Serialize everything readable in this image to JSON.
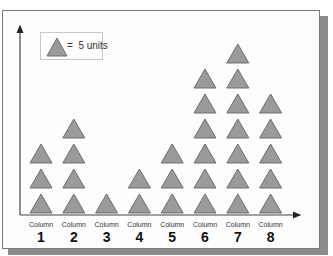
{
  "legend": {
    "icon": "triangle-icon",
    "equals": "=",
    "text": "5 units",
    "unit_value": 5
  },
  "colors": {
    "triangle_fill": "#9a9a9a",
    "triangle_stroke": "#6e6e6e",
    "axis": "#444444",
    "frame": "#7a7a7a",
    "shadow": "#8a8a8a"
  },
  "columns": [
    {
      "label": "Column",
      "number": "1",
      "count": 3
    },
    {
      "label": "Column",
      "number": "2",
      "count": 4
    },
    {
      "label": "Column",
      "number": "3",
      "count": 1
    },
    {
      "label": "Column",
      "number": "4",
      "count": 2
    },
    {
      "label": "Column",
      "number": "5",
      "count": 3
    },
    {
      "label": "Column",
      "number": "6",
      "count": 6
    },
    {
      "label": "Column",
      "number": "7",
      "count": 7
    },
    {
      "label": "Column",
      "number": "8",
      "count": 5
    }
  ],
  "chart_data": {
    "type": "bar",
    "subtype": "pictograph",
    "title": "",
    "xlabel": "",
    "ylabel": "",
    "legend": "triangle = 5 units",
    "categories": [
      "Column 1",
      "Column 2",
      "Column 3",
      "Column 4",
      "Column 5",
      "Column 6",
      "Column 7",
      "Column 8"
    ],
    "symbol_counts": [
      3,
      4,
      1,
      2,
      3,
      6,
      7,
      5
    ],
    "values": [
      15,
      20,
      5,
      10,
      15,
      30,
      35,
      25
    ],
    "grid": false,
    "legend_position": "top-left"
  }
}
